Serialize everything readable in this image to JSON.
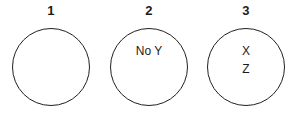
{
  "diagram": {
    "background_color": "#ffffff",
    "stroke_color": "#231f20",
    "text_color": "#1c1c1c",
    "circles": [
      {
        "label": "1",
        "items": [],
        "items_text": ""
      },
      {
        "label": "2",
        "items": [
          "No Y"
        ],
        "items_text": "No Y"
      },
      {
        "label": "3",
        "items": [
          "X",
          "Z"
        ],
        "items_text": "X Z"
      }
    ]
  }
}
